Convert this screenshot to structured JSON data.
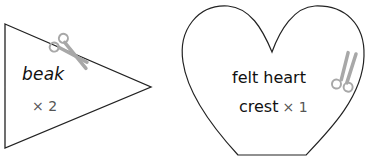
{
  "pieces": [
    {
      "shape": "triangle",
      "label": "beak",
      "quantity": "× 2",
      "cut_icon": "scissors-icon"
    },
    {
      "shape": "heart",
      "label_line1": "felt heart",
      "label_line2": "crest",
      "quantity": "× 1",
      "cut_icon": "scissors-icon"
    }
  ],
  "colors": {
    "outline": "#222222",
    "scissors": "#a8a8a8",
    "text": "#111111",
    "quantity_text": "#555555"
  }
}
